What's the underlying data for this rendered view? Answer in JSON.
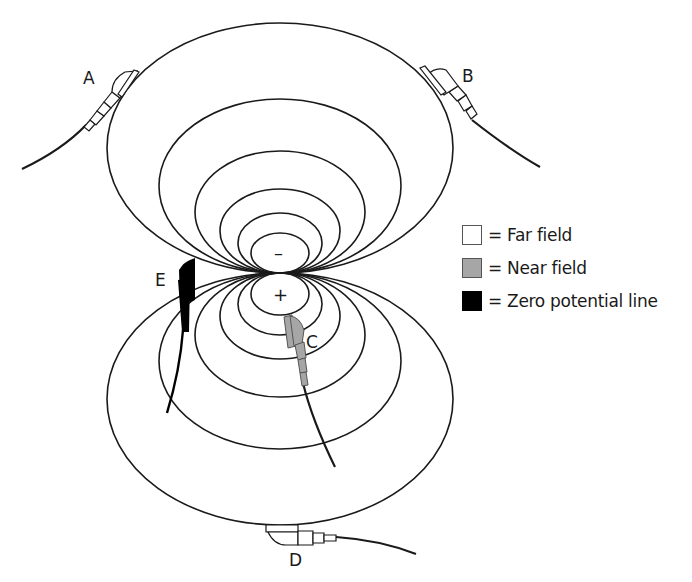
{
  "diagram": {
    "dipole": {
      "negative_sign": "–",
      "positive_sign": "+"
    },
    "electrodes": [
      {
        "id": "A",
        "label": "A",
        "field": "far"
      },
      {
        "id": "B",
        "label": "B",
        "field": "far"
      },
      {
        "id": "C",
        "label": "C",
        "field": "near"
      },
      {
        "id": "D",
        "label": "D",
        "field": "far"
      },
      {
        "id": "E",
        "label": "E",
        "field": "zero"
      }
    ]
  },
  "legend": {
    "items": [
      {
        "label": "= Far field",
        "color": "#ffffff"
      },
      {
        "label": "= Near field",
        "color": "#a6a6a6"
      },
      {
        "label": "= Zero potential line",
        "color": "#000000"
      }
    ]
  },
  "colors": {
    "line": "#1a1a1a",
    "far_field": "#ffffff",
    "near_field": "#a6a6a6",
    "zero_potential": "#000000"
  }
}
